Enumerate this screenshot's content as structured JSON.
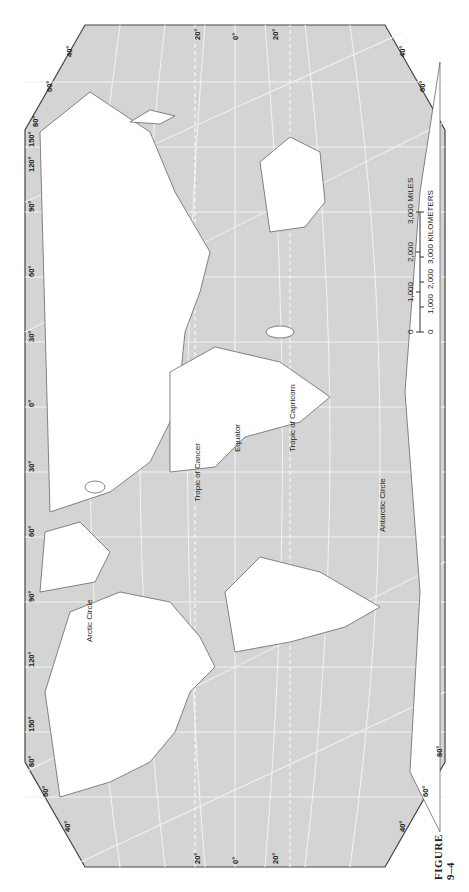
{
  "figure": {
    "caption": "FIGURE 9–4",
    "type": "world map",
    "colors": {
      "ocean": "#d4d4d4",
      "land": "#ffffff",
      "graticule": "#f4f4f4",
      "frame": "#444444",
      "coastline": "#555555"
    }
  },
  "latitude_lines": [
    {
      "id": "arctic",
      "label": "Arctic Circle"
    },
    {
      "id": "cancer",
      "label": "Tropic of Cancer"
    },
    {
      "id": "equator",
      "label": "Equator"
    },
    {
      "id": "capricorn",
      "label": "Tropic of Capricorn"
    },
    {
      "id": "antarctic",
      "label": "Antarctic Circle"
    }
  ],
  "edge_labels": {
    "left": [
      "20°",
      "0°",
      "20°"
    ],
    "right": [
      "20°",
      "0°",
      "20°"
    ],
    "top": [
      "40°",
      "60°",
      "80°",
      "150°",
      "120°",
      "90°",
      "60°",
      "30°",
      "0°",
      "30°",
      "60°",
      "90°",
      "120°",
      "150°",
      "80°",
      "60°",
      "40°"
    ],
    "bottom": [
      "40°",
      "60°",
      "80°",
      "60°",
      "40°"
    ]
  },
  "scale_bar": {
    "miles_ticks": [
      "0",
      "1,000",
      "2,000",
      "3,000 MILES"
    ],
    "km_ticks": [
      "0",
      "1,000",
      "2,000",
      "3,000 KILOMETERS"
    ]
  }
}
